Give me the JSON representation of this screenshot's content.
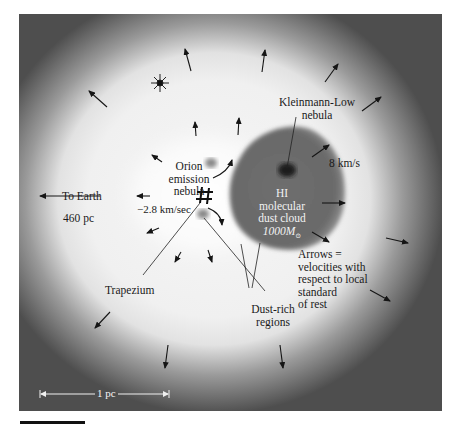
{
  "figure": {
    "labels": {
      "to_earth": "To Earth",
      "distance": "460 pc",
      "orion_line1": "Orion",
      "orion_line2": "emission",
      "orion_line3": "nebula",
      "orion_velocity": "−2.8 km/sec",
      "kl_line1": "Kleinmann-Low",
      "kl_line2": "nebula",
      "speed": "8 km/s",
      "cloud_line1": "HI",
      "cloud_line2": "molecular",
      "cloud_line3": "dust cloud",
      "cloud_mass": "1000M",
      "cloud_mass_sub": "⊙",
      "trapezium": "Trapezium",
      "dust_line1": "Dust-rich",
      "dust_line2": "regions",
      "legend_line1": "Arrows =",
      "legend_line2": "velocities with",
      "legend_line3": "respect to local",
      "legend_line4": "standard",
      "legend_line5": "of rest",
      "scale": "1 pc"
    },
    "colors": {
      "cloud": "#6a6a6a",
      "kl_core": "#1a1a1a",
      "emission_core": "#fbfbfb",
      "outer": "#4a4a4a",
      "arrow": "#151515"
    }
  }
}
